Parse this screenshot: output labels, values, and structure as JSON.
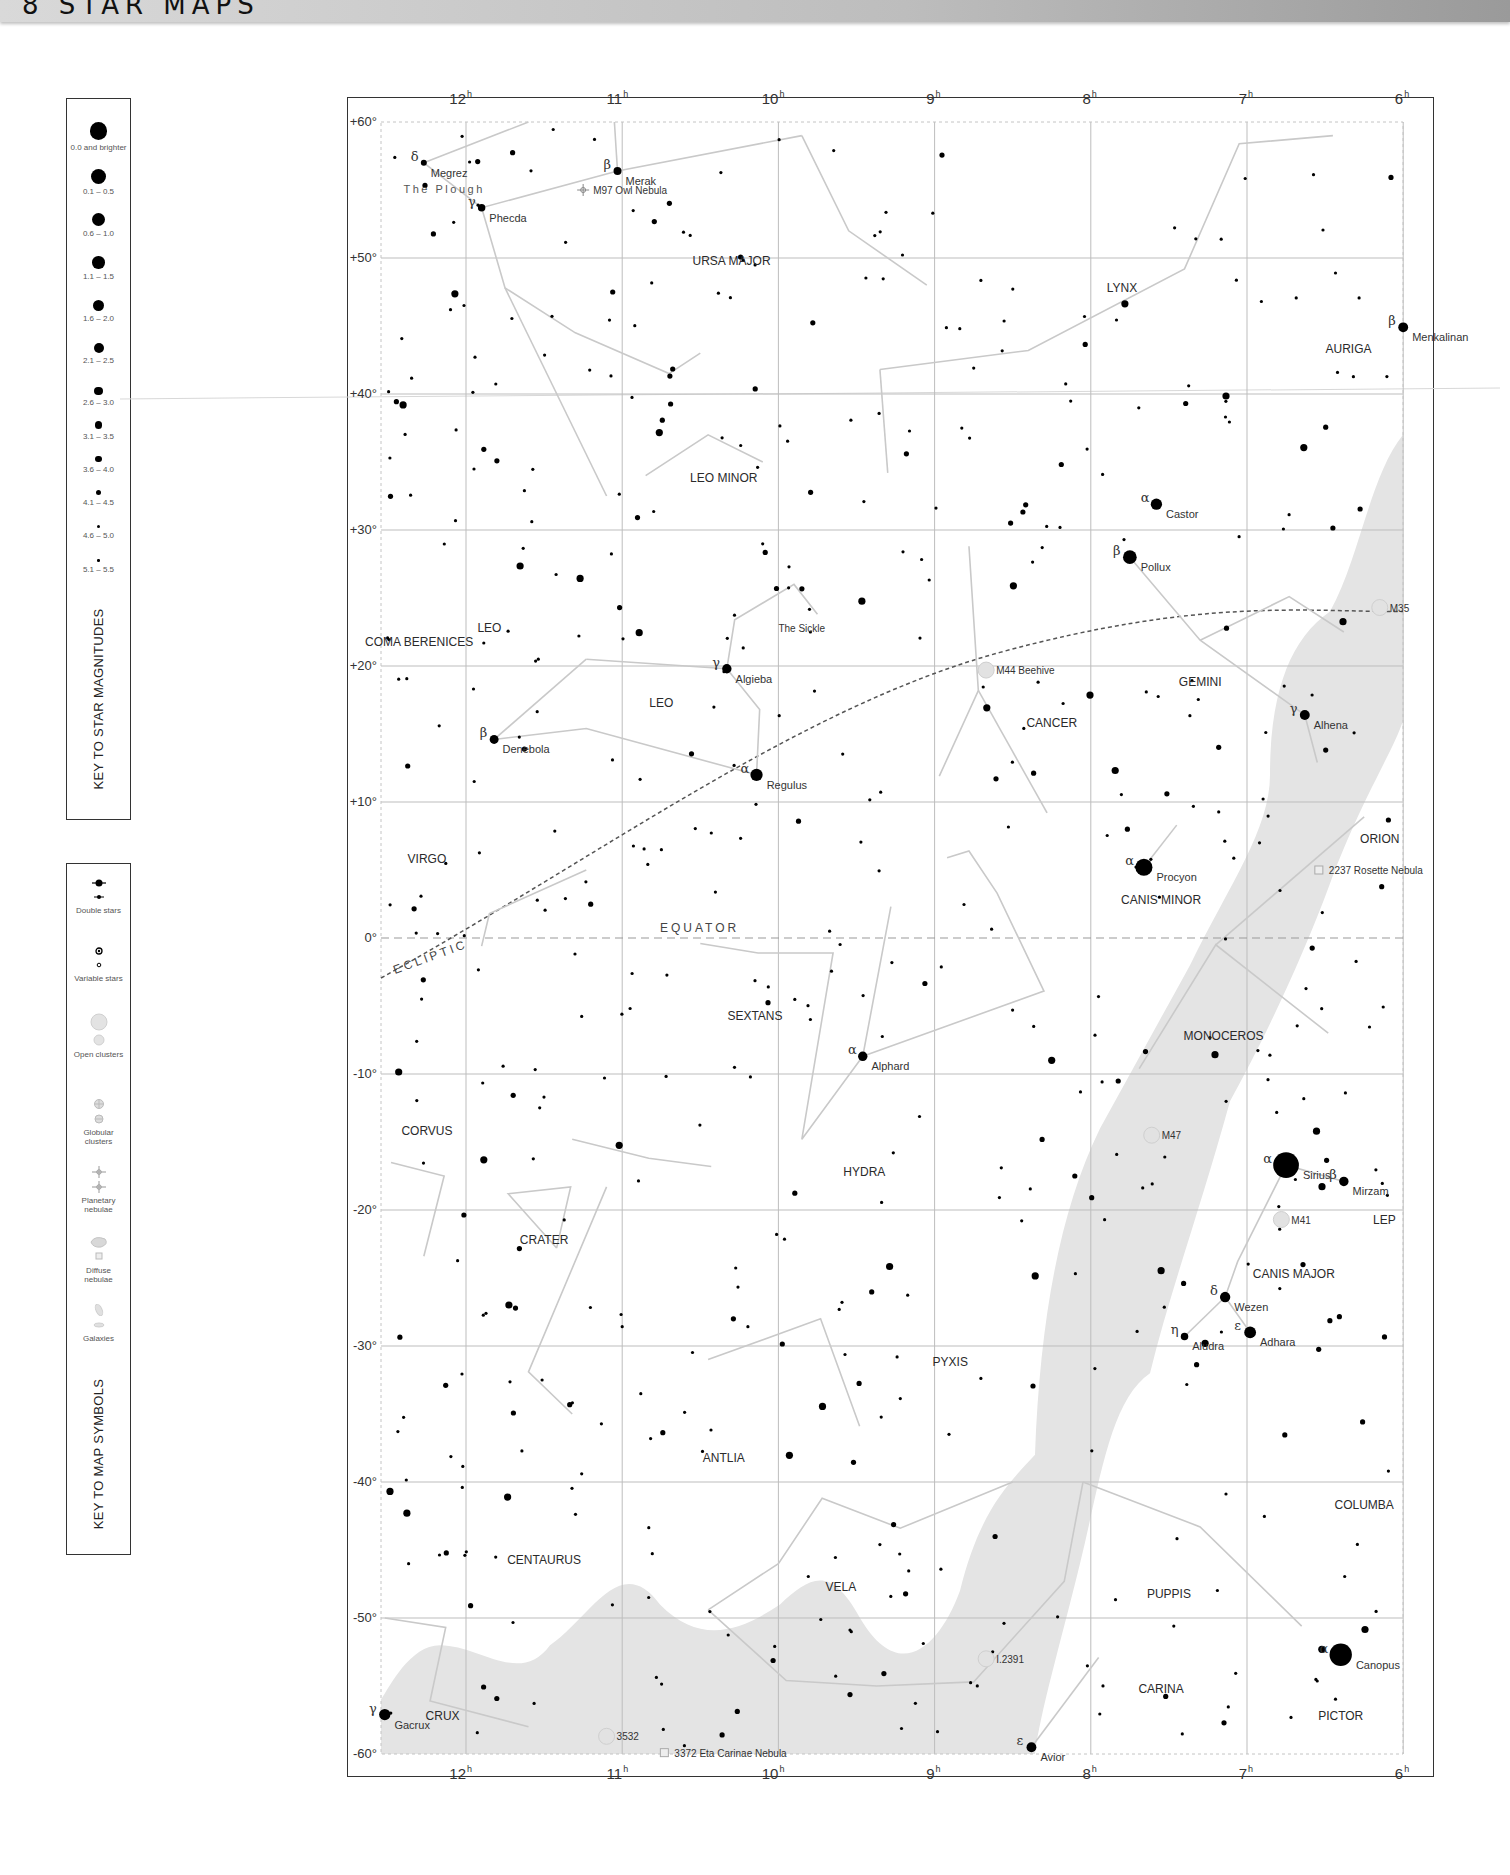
{
  "header": {
    "title": "8 STAR MAPS"
  },
  "key_magnitudes": {
    "title": "KEY TO STAR MAGNITUDES",
    "items": [
      {
        "label": "0.0 and brighter",
        "size": 14
      },
      {
        "label": "0.1 – 0.5",
        "size": 12
      },
      {
        "label": "0.6 – 1.0",
        "size": 11
      },
      {
        "label": "1.1 – 1.5",
        "size": 10
      },
      {
        "label": "1.6 – 2.0",
        "size": 9
      },
      {
        "label": "2.1 – 2.5",
        "size": 8
      },
      {
        "label": "2.6 – 3.0",
        "size": 7
      },
      {
        "label": "3.1 – 3.5",
        "size": 6
      },
      {
        "label": "3.6 – 4.0",
        "size": 5
      },
      {
        "label": "4.1 – 4.5",
        "size": 4
      },
      {
        "label": "4.6 – 5.0",
        "size": 3
      },
      {
        "label": "5.1 – 5.5",
        "size": 2
      }
    ]
  },
  "key_symbols": {
    "title": "KEY TO MAP SYMBOLS",
    "items": [
      {
        "label": "Double stars",
        "symbol": "double-star"
      },
      {
        "label": "Variable stars",
        "symbol": "variable-star"
      },
      {
        "label": "Open clusters",
        "symbol": "open-cluster"
      },
      {
        "label": "Globular clusters",
        "symbol": "globular-cluster"
      },
      {
        "label": "Planetary nebulae",
        "symbol": "planetary-nebula"
      },
      {
        "label": "Diffuse nebulae",
        "symbol": "diffuse-nebula"
      },
      {
        "label": "Galaxies",
        "symbol": "galaxy"
      }
    ]
  },
  "map": {
    "ra_labels": [
      "12h",
      "11h",
      "10h",
      "9h",
      "8h",
      "7h",
      "6h"
    ],
    "dec_labels": [
      "+60°",
      "+50°",
      "+40°",
      "+30°",
      "+20°",
      "+10°",
      "0°",
      "-10°",
      "-20°",
      "-30°",
      "-40°",
      "-50°",
      "-60°"
    ],
    "equator_label": "EQUATOR",
    "ecliptic_label": "ECLIPTIC",
    "colors": {
      "milky_way": "#e4e4e4",
      "grid": "#bdbdbd",
      "boundary": "#c4c4c4",
      "figure": "#c9c9c9",
      "star": "#000000"
    }
  },
  "chart_data": {
    "type": "scatter",
    "xlabel": "Right Ascension (h)",
    "ylabel": "Declination (°)",
    "xlim": [
      12.55,
      6.0
    ],
    "ylim": [
      -60,
      60
    ],
    "grid": true,
    "constellations": [
      {
        "name": "URSA MAJOR",
        "ra": 10.3,
        "dec": 49.5
      },
      {
        "name": "LYNX",
        "ra": 7.8,
        "dec": 47.5
      },
      {
        "name": "AURIGA",
        "ra": 6.35,
        "dec": 43
      },
      {
        "name": "LEO MINOR",
        "ra": 10.35,
        "dec": 33.5
      },
      {
        "name": "COMA BERENICES",
        "ra": 12.3,
        "dec": 21.5
      },
      {
        "name": "LEO",
        "ra": 11.85,
        "dec": 22.5
      },
      {
        "name": "LEO",
        "ra": 10.75,
        "dec": 17
      },
      {
        "name": "GEMINI",
        "ra": 7.3,
        "dec": 18.5
      },
      {
        "name": "CANCER",
        "ra": 8.25,
        "dec": 15.5
      },
      {
        "name": "VIRGO",
        "ra": 12.25,
        "dec": 5.5
      },
      {
        "name": "CANIS MINOR",
        "ra": 7.55,
        "dec": 2.5
      },
      {
        "name": "ORION",
        "ra": 6.15,
        "dec": 7
      },
      {
        "name": "SEXTANS",
        "ra": 10.15,
        "dec": -6
      },
      {
        "name": "MONOCEROS",
        "ra": 7.15,
        "dec": -7.5
      },
      {
        "name": "CORVUS",
        "ra": 12.25,
        "dec": -14.5
      },
      {
        "name": "HYDRA",
        "ra": 9.45,
        "dec": -17.5
      },
      {
        "name": "CRATER",
        "ra": 11.5,
        "dec": -22.5
      },
      {
        "name": "CANIS MAJOR",
        "ra": 6.7,
        "dec": -25
      },
      {
        "name": "LEP",
        "ra": 6.12,
        "dec": -21
      },
      {
        "name": "PYXIS",
        "ra": 8.9,
        "dec": -31.5
      },
      {
        "name": "ANTLIA",
        "ra": 10.35,
        "dec": -38.5
      },
      {
        "name": "COLUMBA",
        "ra": 6.25,
        "dec": -42
      },
      {
        "name": "CENTAURUS",
        "ra": 11.5,
        "dec": -46
      },
      {
        "name": "VELA",
        "ra": 9.6,
        "dec": -48
      },
      {
        "name": "PUPPIS",
        "ra": 7.5,
        "dec": -48.5
      },
      {
        "name": "CARINA",
        "ra": 7.55,
        "dec": -55.5
      },
      {
        "name": "CRUX",
        "ra": 12.15,
        "dec": -57.5
      },
      {
        "name": "PICTOR",
        "ra": 6.4,
        "dec": -57.5
      }
    ],
    "named_stars": [
      {
        "name": "Megrez",
        "greek": "δ",
        "ra": 12.27,
        "dec": 57.0,
        "mag": 3.3
      },
      {
        "name": "Merak",
        "greek": "β",
        "ra": 11.03,
        "dec": 56.4,
        "mag": 2.3
      },
      {
        "name": "Phecda",
        "greek": "γ",
        "ra": 11.9,
        "dec": 53.7,
        "mag": 2.4
      },
      {
        "name": "Menkalinan",
        "greek": "β",
        "ra": 6.0,
        "dec": 44.9,
        "mag": 1.9
      },
      {
        "name": "Castor",
        "greek": "α",
        "ra": 7.58,
        "dec": 31.9,
        "mag": 1.6
      },
      {
        "name": "Pollux",
        "greek": "β",
        "ra": 7.75,
        "dec": 28.0,
        "mag": 1.1
      },
      {
        "name": "Algieba",
        "greek": "γ",
        "ra": 10.33,
        "dec": 19.8,
        "mag": 2.0
      },
      {
        "name": "Denebola",
        "greek": "β",
        "ra": 11.82,
        "dec": 14.6,
        "mag": 2.1
      },
      {
        "name": "Regulus",
        "greek": "α",
        "ra": 10.14,
        "dec": 12.0,
        "mag": 1.4
      },
      {
        "name": "Alhena",
        "greek": "γ",
        "ra": 6.63,
        "dec": 16.4,
        "mag": 1.9
      },
      {
        "name": "Procyon",
        "greek": "α",
        "ra": 7.66,
        "dec": 5.2,
        "mag": 0.4
      },
      {
        "name": "Alphard",
        "greek": "α",
        "ra": 9.46,
        "dec": -8.7,
        "mag": 2.0
      },
      {
        "name": "Sirius",
        "greek": "α",
        "ra": 6.75,
        "dec": -16.7,
        "mag": -1.4
      },
      {
        "name": "Mirzam",
        "greek": "β",
        "ra": 6.38,
        "dec": -17.9,
        "mag": 2.0
      },
      {
        "name": "Wezen",
        "greek": "δ",
        "ra": 7.14,
        "dec": -26.4,
        "mag": 1.8
      },
      {
        "name": "Adhara",
        "greek": "ε",
        "ra": 6.98,
        "dec": -29.0,
        "mag": 1.5
      },
      {
        "name": "Aludra",
        "greek": "η",
        "ra": 7.4,
        "dec": -29.3,
        "mag": 2.4
      },
      {
        "name": "Canopus",
        "greek": "α",
        "ra": 6.4,
        "dec": -52.7,
        "mag": -0.7
      },
      {
        "name": "Avior",
        "greek": "ε",
        "ra": 8.38,
        "dec": -59.5,
        "mag": 1.9
      },
      {
        "name": "Gacrux",
        "greek": "γ",
        "ra": 12.52,
        "dec": -57.1,
        "mag": 1.6
      }
    ],
    "deep_sky": [
      {
        "name": "M97 Owl Nebula",
        "type": "planetary-nebula",
        "ra": 11.25,
        "dec": 55.0
      },
      {
        "name": "M44 Beehive",
        "type": "open-cluster",
        "ra": 8.67,
        "dec": 19.7
      },
      {
        "name": "M35",
        "type": "open-cluster",
        "ra": 6.15,
        "dec": 24.3
      },
      {
        "name": "2237 Rosette Nebula",
        "type": "diffuse-nebula",
        "ra": 6.54,
        "dec": 5.0
      },
      {
        "name": "M47",
        "type": "open-cluster",
        "ra": 7.61,
        "dec": -14.5
      },
      {
        "name": "M41",
        "type": "open-cluster",
        "ra": 6.78,
        "dec": -20.7
      },
      {
        "name": "3532",
        "type": "open-cluster",
        "ra": 11.1,
        "dec": -58.7
      },
      {
        "name": "3372 Eta Carinae Nebula",
        "type": "diffuse-nebula",
        "ra": 10.73,
        "dec": -59.9
      },
      {
        "name": "I.2391",
        "type": "open-cluster",
        "ra": 8.67,
        "dec": -53.0
      }
    ]
  }
}
